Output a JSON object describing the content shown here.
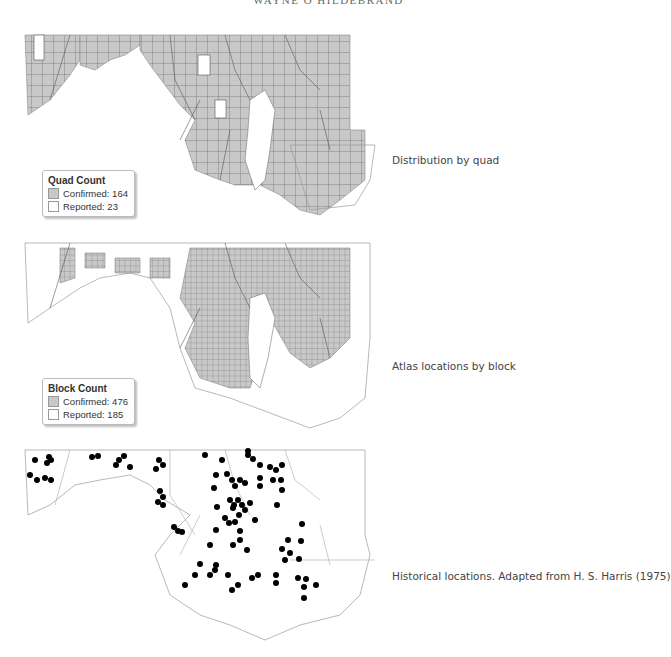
{
  "page": {
    "running_head": "WAYNE O HILDEBRAND"
  },
  "panels": [
    {
      "id": "quad",
      "caption": "Distribution by quad",
      "legend": {
        "title": "Quad Count",
        "items": [
          {
            "label": "Confirmed: 164",
            "color": "#c8c8c8"
          },
          {
            "label": "Reported: 23",
            "color": "#ffffff"
          }
        ]
      }
    },
    {
      "id": "block",
      "caption": "Atlas locations by block",
      "legend": {
        "title": "Block Count",
        "items": [
          {
            "label": "Confirmed: 476",
            "color": "#c8c8c8"
          },
          {
            "label": "Reported: 185",
            "color": "#ffffff"
          }
        ]
      }
    },
    {
      "id": "historical",
      "caption": "Historical locations. Adapted from H. S. Harris (1975)"
    }
  ],
  "colors": {
    "confirmed_fill": "#c8c8c8",
    "reported_fill": "#ffffff",
    "grid_line": "#555555",
    "boundary": "#999999",
    "dot": "#000000"
  }
}
